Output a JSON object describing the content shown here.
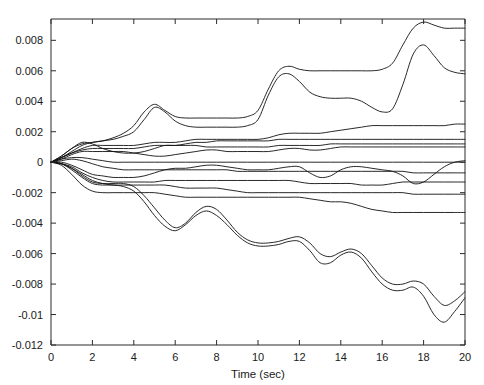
{
  "chart_data": {
    "type": "line",
    "title": "",
    "subtitle": "",
    "xlabel": "Time (sec)",
    "ylabel": "",
    "xlim": [
      0,
      20
    ],
    "ylim": [
      -0.012,
      0.0094
    ],
    "grid": false,
    "legend": false,
    "legend_position": "none",
    "line_color": "#111111",
    "background_color": "#ffffff",
    "axis_color": "#2b2b2b",
    "xticks": [
      0,
      2,
      4,
      6,
      8,
      10,
      12,
      14,
      16,
      18,
      20
    ],
    "xtick_labels": [
      "0",
      "2",
      "4",
      "6",
      "8",
      "10",
      "12",
      "14",
      "16",
      "18",
      "20"
    ],
    "yticks": [
      0.008,
      0.006,
      0.004,
      0.002,
      0,
      -0.002,
      -0.004,
      -0.006,
      -0.008,
      -0.01,
      -0.012
    ],
    "ytick_labels": [
      "0.008",
      "0.006",
      "0.004",
      "0.002",
      "0",
      "-0.002",
      "-0.004",
      "-0.006",
      "-0.008",
      "-0.01",
      "-0.012"
    ],
    "x": [
      0,
      0.5,
      1,
      1.5,
      2,
      2.5,
      3,
      3.5,
      4,
      4.5,
      5,
      5.5,
      6,
      6.5,
      7,
      7.5,
      8,
      8.5,
      9,
      9.5,
      10,
      10.5,
      11,
      11.5,
      12,
      12.5,
      13,
      13.5,
      14,
      14.5,
      15,
      15.5,
      16,
      16.5,
      17,
      17.5,
      18,
      18.5,
      19,
      19.5,
      20
    ],
    "series": [
      {
        "name": "s1",
        "values": [
          0,
          0.0004,
          0.0009,
          0.0012,
          0.0013,
          0.0014,
          0.0016,
          0.0019,
          0.0024,
          0.0033,
          0.0038,
          0.0034,
          0.003,
          0.0029,
          0.0029,
          0.0029,
          0.0029,
          0.0029,
          0.0029,
          0.003,
          0.0034,
          0.0048,
          0.006,
          0.0063,
          0.0061,
          0.006,
          0.006,
          0.006,
          0.006,
          0.006,
          0.006,
          0.006,
          0.0061,
          0.0065,
          0.0077,
          0.0088,
          0.0092,
          0.009,
          0.0088,
          0.0088,
          0.0088
        ]
      },
      {
        "name": "s2",
        "values": [
          0,
          0.0003,
          0.0007,
          0.0011,
          0.0013,
          0.0014,
          0.0015,
          0.0017,
          0.002,
          0.0028,
          0.0036,
          0.0033,
          0.0027,
          0.0024,
          0.0023,
          0.0023,
          0.0023,
          0.0023,
          0.0023,
          0.0024,
          0.0028,
          0.0044,
          0.0056,
          0.0058,
          0.0053,
          0.0046,
          0.0043,
          0.0042,
          0.0042,
          0.0042,
          0.004,
          0.0036,
          0.0033,
          0.0035,
          0.0051,
          0.0071,
          0.0077,
          0.007,
          0.0062,
          0.0059,
          0.0058
        ]
      },
      {
        "name": "s3",
        "values": [
          0,
          0.0003,
          0.0006,
          0.0009,
          0.0011,
          0.0011,
          0.0011,
          0.0011,
          0.0011,
          0.0012,
          0.0013,
          0.0013,
          0.0013,
          0.0014,
          0.0015,
          0.0015,
          0.0015,
          0.0015,
          0.0015,
          0.0015,
          0.0015,
          0.0016,
          0.0018,
          0.0019,
          0.0019,
          0.0019,
          0.0019,
          0.002,
          0.0021,
          0.0022,
          0.0023,
          0.0024,
          0.0024,
          0.0024,
          0.0024,
          0.0024,
          0.0024,
          0.0024,
          0.0024,
          0.0025,
          0.0025
        ]
      },
      {
        "name": "s4",
        "values": [
          0,
          0.0003,
          0.0006,
          0.0008,
          0.0009,
          0.0009,
          0.0009,
          0.0009,
          0.0009,
          0.001,
          0.0011,
          0.0011,
          0.0011,
          0.0012,
          0.0013,
          0.0013,
          0.0014,
          0.0014,
          0.0014,
          0.0014,
          0.0014,
          0.0014,
          0.0015,
          0.0015,
          0.0015,
          0.0015,
          0.0015,
          0.0015,
          0.0015,
          0.0015,
          0.0015,
          0.0015,
          0.0015,
          0.0015,
          0.0015,
          0.0015,
          0.0015,
          0.0015,
          0.0015,
          0.0015,
          0.0015
        ]
      },
      {
        "name": "s5",
        "values": [
          0,
          0.0004,
          0.0009,
          0.0013,
          0.0012,
          0.0009,
          0.0007,
          0.0006,
          0.0006,
          0.0007,
          0.0009,
          0.0011,
          0.0011,
          0.0011,
          0.0011,
          0.001,
          0.001,
          0.001,
          0.001,
          0.001,
          0.001,
          0.001,
          0.0011,
          0.0011,
          0.0011,
          0.0011,
          0.0011,
          0.0012,
          0.0012,
          0.0012,
          0.0012,
          0.0012,
          0.0012,
          0.0012,
          0.0012,
          0.0012,
          0.0012,
          0.0012,
          0.0012,
          0.0012,
          0.0012
        ]
      },
      {
        "name": "s6",
        "values": [
          0,
          0.0002,
          0.0005,
          0.0007,
          0.0007,
          0.0007,
          0.0007,
          0.0007,
          0.0006,
          0.0005,
          0.0004,
          0.0004,
          0.0005,
          0.0006,
          0.0007,
          0.0008,
          0.0008,
          0.0007,
          0.0007,
          0.0007,
          0.0007,
          0.0007,
          0.0008,
          0.0009,
          0.0009,
          0.0008,
          0.0008,
          0.0009,
          0.001,
          0.001,
          0.001,
          0.001,
          0.001,
          0.001,
          0.001,
          0.001,
          0.001,
          0.001,
          0.001,
          0.001,
          0.001
        ]
      },
      {
        "name": "s7",
        "values": [
          0,
          0.0002,
          0.0003,
          0.0003,
          0.0002,
          0.0001,
          0.0,
          0.0,
          0.0,
          0.0,
          0.0,
          0.0,
          0.0,
          0.0,
          0.0,
          0.0,
          0.0,
          0.0,
          0.0,
          0.0,
          0.0,
          0.0,
          0.0,
          0.0,
          0.0,
          0.0,
          0.0,
          0.0,
          0.0,
          0.0,
          0.0,
          0.0,
          0.0,
          0.0,
          0.0,
          0.0,
          0.0,
          0.0,
          0.0,
          0.0,
          0.0
        ]
      },
      {
        "name": "s8",
        "values": [
          0,
          0.0001,
          0.0002,
          0.0001,
          -0.0001,
          -0.0003,
          -0.0004,
          -0.0005,
          -0.0005,
          -0.0005,
          -0.0005,
          -0.0005,
          -0.0005,
          -0.0005,
          -0.0005,
          -0.0005,
          -0.0005,
          -0.0005,
          -0.0006,
          -0.0006,
          -0.0006,
          -0.0006,
          -0.0006,
          -0.0006,
          -0.0006,
          -0.0006,
          -0.0006,
          -0.0006,
          -0.0006,
          -0.0006,
          -0.0006,
          -0.0006,
          -0.0006,
          -0.0006,
          -0.0006,
          -0.0007,
          -0.0007,
          -0.0007,
          -0.0007,
          -0.0007,
          -0.0007
        ]
      },
      {
        "name": "s9",
        "values": [
          0,
          0.0,
          -0.0002,
          -0.0005,
          -0.0008,
          -0.0009,
          -0.001,
          -0.001,
          -0.001,
          -0.0009,
          -0.0007,
          -0.0005,
          -0.0004,
          -0.0004,
          -0.0003,
          -0.0002,
          -0.0002,
          -0.0003,
          -0.0004,
          -0.0005,
          -0.0005,
          -0.0005,
          -0.0004,
          -0.0003,
          -0.0003,
          -0.0007,
          -0.001,
          -0.0009,
          -0.0005,
          -0.0003,
          -0.0003,
          -0.0004,
          -0.0005,
          -0.0006,
          -0.0009,
          -0.0014,
          -0.0013,
          -0.0008,
          -0.0003,
          0.0,
          0.0001
        ]
      },
      {
        "name": "s10",
        "values": [
          0,
          -0.0001,
          -0.0003,
          -0.0007,
          -0.001,
          -0.0012,
          -0.0013,
          -0.0013,
          -0.0013,
          -0.0013,
          -0.0013,
          -0.0012,
          -0.0012,
          -0.0012,
          -0.0012,
          -0.0012,
          -0.0012,
          -0.0012,
          -0.0012,
          -0.0012,
          -0.0012,
          -0.0012,
          -0.0012,
          -0.0012,
          -0.0013,
          -0.0014,
          -0.0014,
          -0.0014,
          -0.0014,
          -0.0014,
          -0.0015,
          -0.0015,
          -0.0015,
          -0.0014,
          -0.0013,
          -0.0013,
          -0.0013,
          -0.0013,
          -0.0013,
          -0.0013,
          -0.0013
        ]
      },
      {
        "name": "s11",
        "values": [
          0,
          -0.0001,
          -0.0004,
          -0.0008,
          -0.0012,
          -0.0014,
          -0.0015,
          -0.0015,
          -0.0015,
          -0.0015,
          -0.0015,
          -0.0015,
          -0.0016,
          -0.0017,
          -0.0017,
          -0.0017,
          -0.0017,
          -0.0018,
          -0.0019,
          -0.002,
          -0.002,
          -0.002,
          -0.002,
          -0.002,
          -0.002,
          -0.002,
          -0.002,
          -0.002,
          -0.002,
          -0.002,
          -0.002,
          -0.002,
          -0.002,
          -0.002,
          -0.002,
          -0.0021,
          -0.0021,
          -0.0021,
          -0.0021,
          -0.0021,
          -0.0021
        ]
      },
      {
        "name": "s12",
        "values": [
          0,
          -0.0002,
          -0.0008,
          -0.0015,
          -0.0019,
          -0.002,
          -0.002,
          -0.002,
          -0.002,
          -0.002,
          -0.002,
          -0.0021,
          -0.0022,
          -0.0023,
          -0.0023,
          -0.0023,
          -0.0023,
          -0.0023,
          -0.0023,
          -0.0023,
          -0.0023,
          -0.0023,
          -0.0023,
          -0.0023,
          -0.0023,
          -0.0024,
          -0.0025,
          -0.0026,
          -0.0026,
          -0.0027,
          -0.0029,
          -0.0031,
          -0.0032,
          -0.0033,
          -0.0033,
          -0.0033,
          -0.0033,
          -0.0033,
          -0.0033,
          -0.0033,
          -0.0033
        ]
      },
      {
        "name": "s13",
        "values": [
          0,
          -0.0001,
          -0.0004,
          -0.0009,
          -0.0013,
          -0.0014,
          -0.0014,
          -0.0014,
          -0.0016,
          -0.0022,
          -0.003,
          -0.0038,
          -0.0043,
          -0.004,
          -0.0033,
          -0.0029,
          -0.0031,
          -0.0038,
          -0.0046,
          -0.0051,
          -0.0053,
          -0.0053,
          -0.0052,
          -0.005,
          -0.0049,
          -0.0053,
          -0.006,
          -0.0062,
          -0.0059,
          -0.0057,
          -0.006,
          -0.0068,
          -0.0076,
          -0.008,
          -0.008,
          -0.0078,
          -0.008,
          -0.0088,
          -0.0094,
          -0.0091,
          -0.0085
        ]
      },
      {
        "name": "s14",
        "values": [
          0,
          -0.0001,
          -0.0005,
          -0.001,
          -0.0014,
          -0.0015,
          -0.0015,
          -0.0016,
          -0.0019,
          -0.0026,
          -0.0035,
          -0.0042,
          -0.0045,
          -0.0041,
          -0.0035,
          -0.0032,
          -0.0035,
          -0.0041,
          -0.0048,
          -0.0053,
          -0.0055,
          -0.0055,
          -0.0054,
          -0.0052,
          -0.0052,
          -0.0058,
          -0.0066,
          -0.0066,
          -0.0061,
          -0.0059,
          -0.0063,
          -0.0072,
          -0.008,
          -0.0084,
          -0.0084,
          -0.0082,
          -0.0088,
          -0.01,
          -0.0105,
          -0.0098,
          -0.0089
        ]
      }
    ]
  }
}
